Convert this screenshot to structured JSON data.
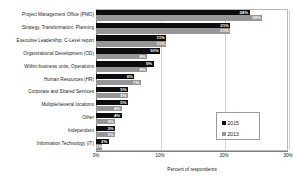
{
  "chart_data": {
    "type": "bar",
    "orientation": "horizontal",
    "title": "",
    "xlabel": "Percent of respondents",
    "ylabel": "",
    "xlim": [
      0,
      30
    ],
    "xticks": [
      "0%",
      "10%",
      "20%",
      "30%"
    ],
    "xtick_values": [
      0,
      10,
      20,
      30
    ],
    "grid": true,
    "legend_position": "inside-right",
    "categories": [
      "Project Management Office  (PMO)",
      "Strategy, Transformation, Planning",
      "Executive Leadership, C-Level report",
      "Organizational Development (OD)",
      "Within business units, Operations",
      "Human Resources (HR)",
      "Corporate and Shared Services",
      "Multiple/several locations",
      "Other",
      "Independent",
      "Information Technology (IT)"
    ],
    "series": [
      {
        "name": "2015",
        "color": "#0d0d0d",
        "values": [
          24,
          21,
          11,
          10,
          9,
          6,
          5,
          5,
          4,
          3,
          2
        ],
        "labels": [
          "24%",
          "21%",
          "11%",
          "10%",
          "9%",
          "6%",
          "5%",
          "5%",
          "4%",
          "3%",
          "2%"
        ]
      },
      {
        "name": "2013",
        "color": "#969696",
        "values": [
          26,
          21,
          11,
          8,
          8,
          7,
          5,
          4,
          3,
          3,
          1
        ],
        "labels": [
          "26%",
          "21%",
          "11%",
          "8%",
          "8%",
          "7%",
          "5%",
          "4%",
          "3%",
          "3%",
          "1%"
        ]
      }
    ]
  },
  "legend": {
    "items": [
      {
        "label": "2015",
        "color": "#0d0d0d"
      },
      {
        "label": "2013",
        "color": "#969696"
      }
    ]
  },
  "colors": {
    "series_2015": "#0d0d0d",
    "series_2013": "#969696",
    "grid": "#d2d2d2",
    "axis": "#808080",
    "background": "#ffffff"
  }
}
